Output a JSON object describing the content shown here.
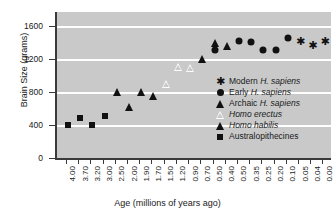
{
  "chart_data": {
    "type": "scatter",
    "title": "",
    "xlabel": "Age (millions of years ago)",
    "ylabel": "Brain Size (grams)",
    "ylim": [
      0,
      1750
    ],
    "yticks": [
      0,
      400,
      800,
      1200,
      1600
    ],
    "grid": true,
    "grid_values": [
      400,
      800,
      1200,
      1600
    ],
    "legend_position": "inside-lower-right",
    "categories": [
      "4.00",
      "3.70",
      "3.20",
      "3.00",
      "2.50",
      "2.00",
      "1.90",
      "1.70",
      "1.50",
      "1.20",
      "0.90",
      "0.70",
      "0.50",
      "0.40",
      "0.50",
      "0.35",
      "0.25",
      "0.20",
      "0.10",
      "0.05",
      "0.04",
      "0.00"
    ],
    "series": [
      {
        "name": "Australopithecines",
        "marker": "square-filled",
        "points": [
          {
            "x": "4.00",
            "y": 400
          },
          {
            "x": "3.70",
            "y": 490
          },
          {
            "x": "3.20",
            "y": 395
          },
          {
            "x": "3.00",
            "y": 510
          }
        ]
      },
      {
        "name": "Homo habilis",
        "marker": "triangle-filled",
        "points": [
          {
            "x": "2.50",
            "y": 800
          },
          {
            "x": "2.00",
            "y": 620
          },
          {
            "x": "1.90",
            "y": 805
          },
          {
            "x": "1.70",
            "y": 750
          }
        ]
      },
      {
        "name": "Homo erectus",
        "marker": "triangle-open",
        "points": [
          {
            "x": "1.50",
            "y": 900
          },
          {
            "x": "1.20",
            "y": 1105
          },
          {
            "x": "0.90",
            "y": 1095
          }
        ]
      },
      {
        "name": "Archaic H. sapiens",
        "marker": "triangle-filled",
        "points": [
          {
            "x": "0.70",
            "y": 1205
          },
          {
            "x": "0.50",
            "y": 1400
          },
          {
            "x": "0.40",
            "y": 1360
          }
        ]
      },
      {
        "name": "Early H. sapiens",
        "marker": "circle-filled",
        "points": [
          {
            "x": "0.50",
            "y": 1305
          },
          {
            "x": "0.50",
            "y": 1415
          },
          {
            "x": "0.35",
            "y": 1410
          },
          {
            "x": "0.25",
            "y": 1310
          },
          {
            "x": "0.20",
            "y": 1310
          },
          {
            "x": "0.10",
            "y": 1455
          }
        ]
      },
      {
        "name": "Modern H. sapiens",
        "marker": "asterisk",
        "points": [
          {
            "x": "0.05",
            "y": 1410
          },
          {
            "x": "0.04",
            "y": 1360
          },
          {
            "x": "0.00",
            "y": 1410
          }
        ]
      }
    ]
  },
  "legend": {
    "entries": [
      {
        "marker": "asterisk",
        "prefix": "Modern ",
        "italic": "H. sapiens",
        "suffix": ""
      },
      {
        "marker": "circle-filled",
        "prefix": "Early ",
        "italic": "H. sapiens",
        "suffix": ""
      },
      {
        "marker": "triangle-filled",
        "prefix": "Archaic ",
        "italic": "H. sapiens",
        "suffix": ""
      },
      {
        "marker": "triangle-open",
        "prefix": "",
        "italic": "Homo erectus",
        "suffix": ""
      },
      {
        "marker": "triangle-filled",
        "prefix": "",
        "italic": "Homo habilis",
        "suffix": ""
      },
      {
        "marker": "square-filled",
        "prefix": "Australopithecines",
        "italic": "",
        "suffix": ""
      }
    ]
  },
  "colors": {
    "plot_background": "#c9c9c9",
    "gridline": "#ffffff",
    "marker": "#111111",
    "axis": "#3a3a3a",
    "page_background": "#ffffff"
  }
}
